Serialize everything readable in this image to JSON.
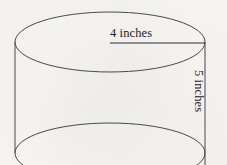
{
  "figure": {
    "shape_name": "cylinder",
    "background_color": "#f6f5f3",
    "stroke_color": "#4a4a4a",
    "text_color": "#1b1b1b",
    "labels": {
      "radius": "4 inches",
      "height": "5 inches"
    },
    "geometry": {
      "top_ellipse": {
        "cx": 110,
        "cy": 42,
        "rx": 95,
        "ry": 30
      },
      "bottom_ellipse": {
        "cx": 110,
        "cy": 153,
        "rx": 95,
        "ry": 30
      },
      "left_side": {
        "x": 15,
        "y1": 42,
        "y2": 153
      },
      "right_side": {
        "x": 205,
        "y1": 42,
        "y2": 165
      },
      "radius_line": {
        "x1": 110,
        "y1": 43,
        "x2": 205,
        "y2": 43
      }
    }
  }
}
